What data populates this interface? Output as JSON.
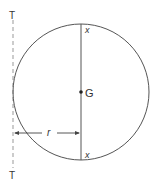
{
  "diagram": {
    "type": "circle-radius-of-gyration",
    "colors": {
      "stroke": "#555555",
      "dashed_axis": "#999999",
      "text": "#333333"
    },
    "labels": {
      "axis_top": "T",
      "axis_bottom": "T",
      "centroid": "G",
      "diameter_top": "x",
      "diameter_bottom": "x",
      "radius": "r"
    },
    "elements": {
      "circle": {
        "cx": 81,
        "cy": 92,
        "r": 68
      },
      "axis_line": {
        "x": 13,
        "y1": 20,
        "y2": 168,
        "style": "dashed"
      },
      "diameter_line": {
        "x": 81,
        "y1": 24,
        "y2": 160
      },
      "centroid_point": {
        "x": 81,
        "y": 92
      },
      "radius_dimension": {
        "y": 133,
        "x1": 14,
        "x2": 80
      }
    }
  }
}
